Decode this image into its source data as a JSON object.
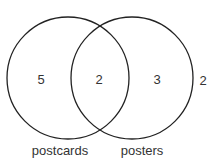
{
  "diagram": {
    "type": "venn",
    "sets": [
      {
        "name": "postcards",
        "only_count": "5"
      },
      {
        "name": "posters",
        "only_count": "3"
      }
    ],
    "intersection_count": "2",
    "outside_count": "2",
    "colors": {
      "stroke": "#222222",
      "text": "#333333",
      "background": "#ffffff"
    }
  }
}
